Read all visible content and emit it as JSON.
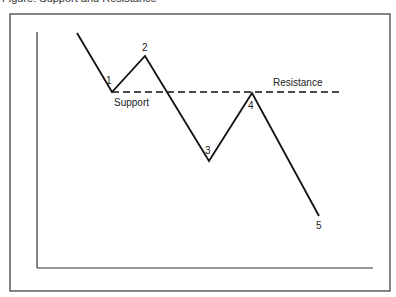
{
  "caption": "Figure: Support and Resistance",
  "diagram": {
    "type": "price-wave-diagram",
    "points": [
      {
        "id": "start",
        "x": 77,
        "y": 33,
        "label": ""
      },
      {
        "id": "p1",
        "x": 112,
        "y": 92,
        "label": "1"
      },
      {
        "id": "p2",
        "x": 145,
        "y": 56,
        "label": "2"
      },
      {
        "id": "p3",
        "x": 209,
        "y": 161,
        "label": "3"
      },
      {
        "id": "p4",
        "x": 252,
        "y": 93,
        "label": "4"
      },
      {
        "id": "p5",
        "x": 319,
        "y": 216,
        "label": "5"
      }
    ],
    "support_label": "Support",
    "resistance_label": "Resistance",
    "colors": {
      "line": "#111111",
      "frame": "#333333"
    }
  }
}
